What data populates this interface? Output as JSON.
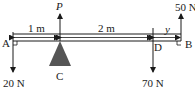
{
  "diagram": {
    "points": {
      "A": "A",
      "B": "B",
      "C": "C",
      "D": "D"
    },
    "forces": {
      "A": "20 N",
      "C": "P",
      "D": "70 N",
      "B": "50 N"
    },
    "dimensions": {
      "AC": "1 m",
      "CD": "2 m",
      "DB": "y"
    },
    "colors": {
      "line": "#1a1a1a",
      "support": "#555555"
    }
  }
}
